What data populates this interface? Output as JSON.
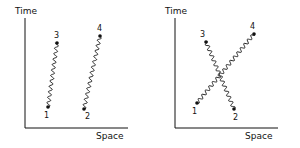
{
  "panels": [
    {
      "id": "left",
      "y_axis_label": "Time",
      "x_axis_label": "Space",
      "description": "Two separate worldlines (no interaction)",
      "points": [
        {
          "label": "1",
          "x": 48,
          "y": 107
        },
        {
          "label": "3",
          "x": 57,
          "y": 43
        },
        {
          "label": "2",
          "x": 84,
          "y": 109
        },
        {
          "label": "4",
          "x": 100,
          "y": 36
        }
      ],
      "lines": [
        {
          "from": "1",
          "to": "3"
        },
        {
          "from": "2",
          "to": "4"
        }
      ]
    },
    {
      "id": "right",
      "y_axis_label": "Time",
      "x_axis_label": "Space",
      "description": "Crossing worldlines (exchange)",
      "points": [
        {
          "label": "1",
          "x": 197,
          "y": 103
        },
        {
          "label": "4",
          "x": 254,
          "y": 34
        },
        {
          "label": "3",
          "x": 206,
          "y": 42
        },
        {
          "label": "2",
          "x": 234,
          "y": 109
        }
      ],
      "lines": [
        {
          "from": "1",
          "to": "4"
        },
        {
          "from": "2",
          "to": "3"
        }
      ]
    }
  ],
  "colors": {
    "ink": "#111111",
    "background": "#ffffff"
  }
}
